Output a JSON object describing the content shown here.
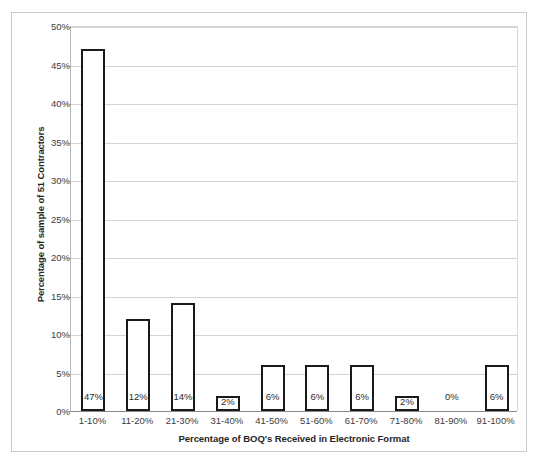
{
  "chart_data": {
    "type": "bar",
    "title": "",
    "categories": [
      "1-10%",
      "11-20%",
      "21-30%",
      "31-40%",
      "41-50%",
      "51-60%",
      "61-70%",
      "71-80%",
      "81-90%",
      "91-100%"
    ],
    "values": [
      47,
      12,
      14,
      2,
      6,
      6,
      6,
      2,
      0,
      6
    ],
    "data_labels": [
      "47%",
      "12%",
      "14%",
      "2%",
      "6%",
      "6%",
      "6%",
      "2%",
      "0%",
      "6%"
    ],
    "xlabel": "Percentage of BOQ's Received in Electronic Format",
    "ylabel": "Percentage of sample of 51 Contractors",
    "ylim": [
      0,
      50
    ],
    "y_tick_values": [
      0,
      5,
      10,
      15,
      20,
      25,
      30,
      35,
      40,
      45,
      50
    ],
    "y_tick_labels": [
      "0%",
      "5%",
      "10%",
      "15%",
      "20%",
      "25%",
      "30%",
      "35%",
      "40%",
      "45%",
      "50%"
    ],
    "grid": true,
    "legend": false,
    "legend_position": "none",
    "bar_fill_color": "#ffffff",
    "bar_border_color": "#1a1a1a",
    "gridline_color": "#d4d4d4",
    "axis_color": "#8a8a8a",
    "series": [
      {
        "name": "Percentage of sample of 51 Contractors",
        "values": [
          47,
          12,
          14,
          2,
          6,
          6,
          6,
          2,
          0,
          6
        ]
      }
    ]
  },
  "frame": {
    "cropped_title_fragment": ""
  }
}
